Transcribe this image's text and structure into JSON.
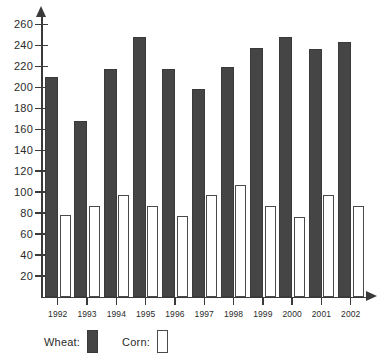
{
  "chart_data": {
    "type": "bar",
    "title": "",
    "subtitle": "",
    "xlabel": "",
    "ylabel": "",
    "categories": [
      "1992",
      "1993",
      "1994",
      "1995",
      "1996",
      "1997",
      "1998",
      "1999",
      "2000",
      "2001",
      "2002"
    ],
    "series": [
      {
        "name": "Wheat:",
        "color": "#454545",
        "style": "filled",
        "values": [
          210,
          168,
          218,
          248,
          218,
          198,
          219,
          238,
          248,
          237,
          243
        ]
      },
      {
        "name": "Corn:",
        "color": "#ffffff",
        "style": "outlined",
        "values": [
          78,
          87,
          97,
          87,
          77,
          97,
          107,
          87,
          76,
          97,
          87
        ]
      }
    ],
    "ylim": [
      0,
      270
    ],
    "ytick_values": [
      20,
      40,
      60,
      80,
      100,
      120,
      140,
      160,
      180,
      200,
      220,
      240,
      260
    ],
    "ytick_labels": [
      "20",
      "40",
      "60",
      "80",
      "100",
      "120",
      "140",
      "160",
      "180",
      "200",
      "220",
      "240",
      "260"
    ],
    "grid": false,
    "legend_position": "bottom-left",
    "axis_color": "#3a3a3a"
  },
  "legend": {
    "wheat_label": "Wheat:",
    "corn_label": "Corn:"
  }
}
